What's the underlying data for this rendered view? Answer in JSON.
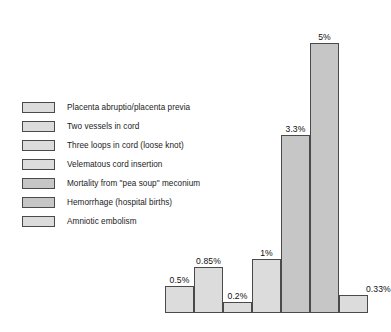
{
  "legend": {
    "items": [
      {
        "label": "Placenta abruptio/placenta previa",
        "swatch": "#dcdcdc"
      },
      {
        "label": "Two vessels in cord",
        "swatch": "#dcdcdc"
      },
      {
        "label": "Three loops in cord (loose knot)",
        "swatch": "#dcdcdc"
      },
      {
        "label": "Velematous cord insertion",
        "swatch": "#dcdcdc"
      },
      {
        "label": "Mortality from \"pea soup\" meconium",
        "swatch": "#c6c6c6"
      },
      {
        "label": "Hemorrhage (hospital births)",
        "swatch": "#c6c6c6"
      },
      {
        "label": "Amniotic embolism",
        "swatch": "#dcdcdc"
      }
    ]
  },
  "chart_data": {
    "type": "bar",
    "title": "",
    "subtitle": "",
    "xlabel": "",
    "ylabel": "",
    "ylim": [
      0,
      5.3
    ],
    "grid": false,
    "legend_position": "upper-left",
    "categories": [
      "Placenta abruptio/placenta previa",
      "Two vessels in cord",
      "Three loops in cord (loose knot)",
      "Velematous cord insertion",
      "Mortality from \"pea soup\" meconium",
      "Hemorrhage (hospital births)",
      "Amniotic embolism"
    ],
    "values": [
      0.5,
      0.85,
      0.2,
      1,
      3.3,
      5,
      0.33
    ],
    "data_labels": [
      "0.5%",
      "0.85%",
      "0.2%",
      "1%",
      "3.3%",
      "5%",
      "0.33%"
    ],
    "bar_colors": [
      "#dcdcdc",
      "#dcdcdc",
      "#dcdcdc",
      "#dcdcdc",
      "#c6c6c6",
      "#c6c6c6",
      "#dcdcdc"
    ],
    "bar_edge_color": "#4a4a4a",
    "axis_color": "#4a4a4a",
    "tick_labels_x": [],
    "tick_labels_y": []
  }
}
